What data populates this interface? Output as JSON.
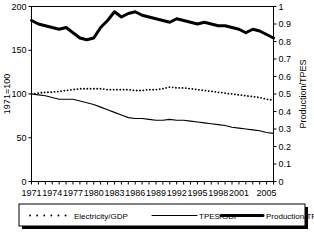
{
  "chart_data": {
    "type": "line",
    "title": "",
    "xlabel": "",
    "ylabel": "1971=100",
    "y2label": "Production/TPES",
    "grid": false,
    "legend_position": "bottom",
    "xlim": [
      1971,
      2006
    ],
    "ylim": [
      0,
      200
    ],
    "y2lim": [
      0,
      1
    ],
    "yticks": [
      0,
      50,
      100,
      150,
      200
    ],
    "ytick_labels": [
      "0",
      "50",
      "100",
      "150",
      "200"
    ],
    "y2ticks": [
      0,
      0.1,
      0.2,
      0.3,
      0.4,
      0.5,
      0.6,
      0.7,
      0.8,
      0.9,
      1
    ],
    "y2tick_labels": [
      "0",
      "0.1",
      "0.2",
      "0.3",
      "0.4",
      "0.5",
      "0.6",
      "0.7",
      "0.8",
      "0.9",
      "1"
    ],
    "x": [
      1971,
      1972,
      1973,
      1974,
      1975,
      1976,
      1977,
      1978,
      1979,
      1980,
      1981,
      1982,
      1983,
      1984,
      1985,
      1986,
      1987,
      1988,
      1989,
      1990,
      1991,
      1992,
      1993,
      1994,
      1995,
      1996,
      1997,
      1998,
      1999,
      2000,
      2001,
      2002,
      2003,
      2004,
      2005,
      2006
    ],
    "xtick_labels": [
      "1971",
      "1974",
      "1977",
      "1980",
      "1983",
      "1986",
      "1989",
      "1992",
      "1995",
      "1998",
      "2001",
      "2005"
    ],
    "xtick_values": [
      1971,
      1974,
      1977,
      1980,
      1983,
      1986,
      1989,
      1992,
      1995,
      1998,
      2001,
      2005
    ],
    "series": [
      {
        "name": "Electricity/GDP",
        "axis": "left",
        "style": "dotted",
        "values": [
          100,
          101,
          102,
          102,
          103,
          104,
          105,
          106,
          106,
          106,
          106,
          105,
          105,
          105,
          105,
          104,
          104,
          105,
          105,
          106,
          108,
          107,
          107,
          106,
          105,
          104,
          103,
          102,
          101,
          100,
          99,
          98,
          97,
          96,
          94,
          93
        ]
      },
      {
        "name": "TPES/GDP",
        "axis": "left",
        "style": "thin-solid",
        "values": [
          100,
          99,
          98,
          96,
          94,
          94,
          94,
          92,
          90,
          88,
          85,
          82,
          79,
          76,
          73,
          72,
          72,
          71,
          70,
          70,
          71,
          70,
          70,
          69,
          68,
          67,
          66,
          65,
          64,
          62,
          61,
          60,
          59,
          58,
          56,
          55
        ]
      },
      {
        "name": "Production/TPES",
        "axis": "right",
        "style": "thick-solid",
        "values": [
          0.92,
          0.9,
          0.89,
          0.88,
          0.87,
          0.88,
          0.85,
          0.82,
          0.81,
          0.82,
          0.88,
          0.92,
          0.97,
          0.94,
          0.96,
          0.97,
          0.95,
          0.94,
          0.93,
          0.92,
          0.91,
          0.93,
          0.92,
          0.91,
          0.9,
          0.91,
          0.9,
          0.89,
          0.89,
          0.88,
          0.87,
          0.85,
          0.87,
          0.86,
          0.84,
          0.82
        ]
      }
    ]
  },
  "axes": {
    "left_title": "1971=100",
    "right_title": "Production/TPES"
  },
  "legend": {
    "items": [
      {
        "label": "Electricity/GDP",
        "style": "dotted"
      },
      {
        "label": "TPES/GDP",
        "style": "thin-solid"
      },
      {
        "label": "Production/TPES",
        "style": "thick-solid"
      }
    ]
  }
}
